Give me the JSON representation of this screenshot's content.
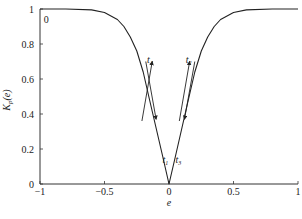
{
  "chart_data": {
    "type": "line",
    "title": "",
    "xlabel": "e",
    "ylabel": "K_p(e)",
    "xlim": [
      -1,
      1
    ],
    "ylim": [
      0,
      1
    ],
    "xticks": [
      "-1",
      "-0.5",
      "0",
      "0.5",
      "1"
    ],
    "xtick_values": [
      -1,
      -0.5,
      0,
      0.5,
      1
    ],
    "yticks": [
      "0",
      "0.2",
      "0.4",
      "0.6",
      "0.8",
      "1"
    ],
    "ytick_values": [
      0,
      0.2,
      0.4,
      0.6,
      0.8,
      1
    ],
    "grid": false,
    "series": [
      {
        "name": "K_p(e)",
        "x": [
          -1,
          -0.8,
          -0.6,
          -0.5,
          -0.4,
          -0.35,
          -0.3,
          -0.25,
          -0.2,
          -0.15,
          -0.1,
          -0.05,
          0,
          0.05,
          0.1,
          0.15,
          0.2,
          0.25,
          0.3,
          0.35,
          0.4,
          0.5,
          0.6,
          0.8,
          1
        ],
        "y": [
          1,
          1,
          0.995,
          0.98,
          0.94,
          0.9,
          0.84,
          0.76,
          0.64,
          0.48,
          0.32,
          0.16,
          0,
          0.16,
          0.32,
          0.48,
          0.64,
          0.76,
          0.84,
          0.9,
          0.94,
          0.98,
          0.995,
          1,
          1
        ]
      }
    ],
    "annotations": [
      {
        "text": "0",
        "x": -0.97,
        "y": 0.92
      },
      {
        "text": "t1",
        "sub": "1",
        "x": -0.05,
        "y": 0.12
      },
      {
        "text": "t2",
        "sub": "2",
        "x": 0.13,
        "y": 0.69
      },
      {
        "text": "t3",
        "sub": "3",
        "x": 0.05,
        "y": 0.12
      },
      {
        "text": "t4",
        "sub": "4",
        "x": -0.17,
        "y": 0.69
      }
    ],
    "arrows": [
      {
        "name": "arrow-t4-up",
        "from": [
          -0.21,
          0.36
        ],
        "to": [
          -0.13,
          0.7
        ]
      },
      {
        "name": "arrow-t1-down",
        "from": [
          -0.18,
          0.7
        ],
        "to": [
          -0.1,
          0.37
        ]
      },
      {
        "name": "arrow-t2-up",
        "from": [
          0.08,
          0.36
        ],
        "to": [
          0.16,
          0.7
        ]
      },
      {
        "name": "arrow-t3-down",
        "from": [
          0.2,
          0.7
        ],
        "to": [
          0.12,
          0.37
        ]
      }
    ]
  }
}
